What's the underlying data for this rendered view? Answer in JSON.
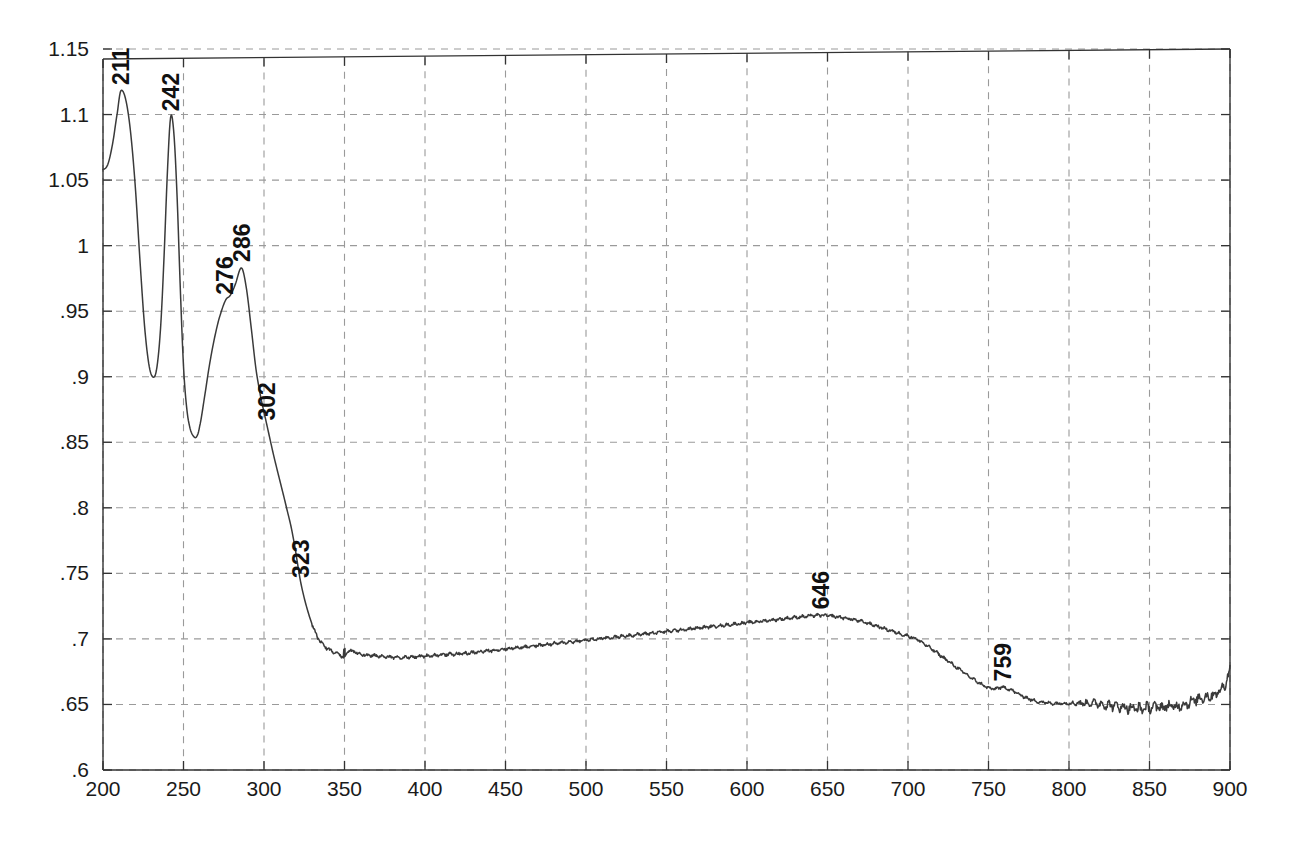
{
  "chart_data": {
    "type": "line",
    "title": "",
    "subtitle": "",
    "xlabel": "",
    "ylabel": "",
    "xlim": [
      200,
      900
    ],
    "ylim": [
      0.6,
      1.15
    ],
    "grid": true,
    "legend": false,
    "legend_position": "none",
    "line_color": "#3a3a3a",
    "grid_color": "#9a9a9a",
    "axis_color": "#333333",
    "background": "#ffffff",
    "xticks": [
      200,
      250,
      300,
      350,
      400,
      450,
      500,
      550,
      600,
      650,
      700,
      750,
      800,
      850,
      900
    ],
    "xtick_labels": [
      "200",
      "250",
      "300",
      "350",
      "400",
      "450",
      "500",
      "550",
      "600",
      "650",
      "700",
      "750",
      "800",
      "850",
      "900"
    ],
    "yticks": [
      0.6,
      0.65,
      0.7,
      0.75,
      0.8,
      0.85,
      0.9,
      0.95,
      1.0,
      1.05,
      1.1,
      1.15
    ],
    "ytick_labels": [
      ".6",
      ".65",
      ".7",
      ".75",
      ".8",
      ".85",
      ".9",
      ".95",
      "1",
      "1.05",
      "1.1",
      "1.15"
    ],
    "annotations": [
      {
        "label": "211",
        "x": 211,
        "y": 1.118,
        "rotation": -90
      },
      {
        "label": "242",
        "x": 242,
        "y": 1.098,
        "rotation": -90
      },
      {
        "label": "276",
        "x": 276,
        "y": 0.958,
        "rotation": -90
      },
      {
        "label": "286",
        "x": 286,
        "y": 0.983,
        "rotation": -90
      },
      {
        "label": "302",
        "x": 302,
        "y": 0.862,
        "rotation": -90
      },
      {
        "label": "323",
        "x": 323,
        "y": 0.742,
        "rotation": -90
      },
      {
        "label": "646",
        "x": 646,
        "y": 0.718,
        "rotation": -90
      },
      {
        "label": "759",
        "x": 759,
        "y": 0.663,
        "rotation": -90
      }
    ],
    "series": [
      {
        "name": "absorbance",
        "x": [
          200,
          203,
          206,
          209,
          211,
          214,
          217,
          220,
          223,
          226,
          229,
          232,
          234,
          236,
          238,
          240,
          242,
          244,
          246,
          248,
          250,
          252,
          254,
          256,
          258,
          260,
          263,
          266,
          269,
          272,
          276,
          279,
          282,
          286,
          289,
          292,
          295,
          298,
          302,
          306,
          310,
          314,
          318,
          323,
          328,
          333,
          338,
          343,
          347,
          350,
          352,
          356,
          362,
          370,
          380,
          390,
          400,
          412,
          425,
          440,
          455,
          470,
          485,
          500,
          515,
          530,
          545,
          560,
          575,
          590,
          605,
          620,
          635,
          646,
          655,
          665,
          675,
          685,
          695,
          705,
          715,
          725,
          735,
          745,
          752,
          759,
          764,
          770,
          778,
          788,
          798,
          808,
          816,
          822,
          828,
          834,
          840,
          846,
          852,
          858,
          862,
          866,
          870,
          874,
          878,
          882,
          886,
          889,
          892,
          895,
          897,
          899,
          900
        ],
        "y": [
          1.058,
          1.062,
          1.078,
          1.102,
          1.118,
          1.112,
          1.088,
          1.046,
          0.988,
          0.936,
          0.906,
          0.9,
          0.912,
          0.942,
          0.994,
          1.056,
          1.098,
          1.086,
          1.038,
          0.968,
          0.908,
          0.876,
          0.861,
          0.855,
          0.854,
          0.862,
          0.884,
          0.908,
          0.928,
          0.944,
          0.958,
          0.962,
          0.97,
          0.983,
          0.968,
          0.938,
          0.906,
          0.884,
          0.862,
          0.84,
          0.82,
          0.8,
          0.778,
          0.742,
          0.718,
          0.702,
          0.694,
          0.69,
          0.688,
          0.686,
          0.691,
          0.69,
          0.688,
          0.687,
          0.686,
          0.686,
          0.687,
          0.688,
          0.689,
          0.691,
          0.693,
          0.695,
          0.697,
          0.699,
          0.701,
          0.703,
          0.705,
          0.707,
          0.709,
          0.711,
          0.713,
          0.715,
          0.717,
          0.718,
          0.717,
          0.715,
          0.712,
          0.708,
          0.704,
          0.7,
          0.692,
          0.683,
          0.674,
          0.666,
          0.662,
          0.663,
          0.661,
          0.657,
          0.653,
          0.651,
          0.651,
          0.651,
          0.651,
          0.65,
          0.649,
          0.648,
          0.647,
          0.647,
          0.648,
          0.648,
          0.649,
          0.648,
          0.65,
          0.651,
          0.653,
          0.655,
          0.656,
          0.657,
          0.659,
          0.662,
          0.666,
          0.672,
          0.676
        ]
      }
    ],
    "noise": {
      "description": "fine measurement ripple superimposed on the trace",
      "ripple_amplitude_mid": 0.0012,
      "ripple_amplitude_tail": 0.004,
      "tail_start_x": 800
    },
    "artifacts": [
      {
        "name": "detector-changeover-step",
        "x": 350,
        "description": "small vertical step discontinuity"
      }
    ]
  }
}
